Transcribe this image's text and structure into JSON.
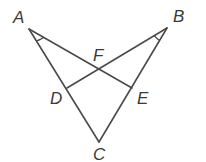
{
  "diagram": {
    "type": "geometry",
    "points": {
      "A": {
        "label": "A",
        "x": 29,
        "y": 29,
        "lx": 13,
        "ly": 23
      },
      "B": {
        "label": "B",
        "x": 167,
        "y": 28,
        "lx": 173,
        "ly": 22
      },
      "C": {
        "label": "C",
        "x": 99,
        "y": 142,
        "lx": 93,
        "ly": 160
      },
      "D": {
        "label": "D",
        "x": 67,
        "y": 88,
        "lx": 50,
        "ly": 104
      },
      "E": {
        "label": "E",
        "x": 132,
        "y": 88,
        "lx": 137,
        "ly": 104
      },
      "F": {
        "label": "F",
        "x": 99,
        "y": 71,
        "lx": 93,
        "ly": 61
      }
    },
    "segments": [
      [
        "A",
        "C"
      ],
      [
        "B",
        "C"
      ],
      [
        "A",
        "E"
      ],
      [
        "B",
        "D"
      ]
    ],
    "angle_marks": [
      {
        "vertex": "A",
        "between": [
          "C",
          "E"
        ],
        "description": "single arc congruence mark"
      },
      {
        "vertex": "B",
        "between": [
          "D",
          "C"
        ],
        "description": "single arc congruence mark"
      }
    ],
    "stroke_color": "#4a4a4a",
    "label_color": "#3a3a3a"
  }
}
